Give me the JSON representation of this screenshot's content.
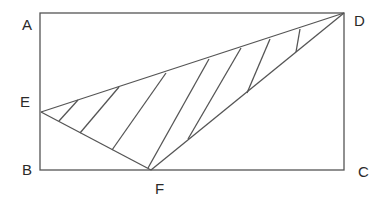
{
  "diagram": {
    "stroke_color": "#555555",
    "rectangle": {
      "vertices": [
        "A",
        "B",
        "C",
        "D"
      ]
    },
    "triangle": {
      "vertices": [
        "E",
        "F",
        "D"
      ],
      "shaded": "hatched region between ED and E-F-D"
    },
    "labels": {
      "A": "A",
      "B": "B",
      "C": "C",
      "D": "D",
      "E": "E",
      "F": "F"
    },
    "points": {
      "A": [
        40,
        13
      ],
      "B": [
        40,
        170
      ],
      "C": [
        344,
        170
      ],
      "D": [
        344,
        13
      ],
      "E": [
        41,
        112
      ],
      "F": [
        151,
        170
      ]
    },
    "hatch_lines": [
      [
        [
          78,
          100
        ],
        [
          59,
          121
        ]
      ],
      [
        [
          119,
          87
        ],
        [
          80,
          133
        ]
      ],
      [
        [
          166,
          73
        ],
        [
          112,
          150
        ]
      ],
      [
        [
          209,
          59
        ],
        [
          148,
          168
        ]
      ],
      [
        [
          241,
          48
        ],
        [
          188,
          139
        ]
      ],
      [
        [
          270,
          39
        ],
        [
          247,
          93
        ]
      ],
      [
        [
          300,
          29
        ],
        [
          296,
          52
        ]
      ]
    ]
  }
}
